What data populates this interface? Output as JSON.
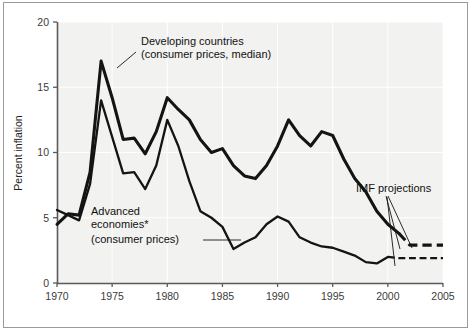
{
  "chart_data": {
    "type": "line",
    "title": "",
    "xlabel": "",
    "ylabel": "Percent inflation",
    "xlim": [
      1970,
      2005
    ],
    "ylim": [
      0,
      20
    ],
    "grid": true,
    "legend_position": "inline-annotations",
    "x_ticks": [
      1970,
      1975,
      1980,
      1985,
      1990,
      1995,
      2000,
      2005
    ],
    "y_ticks": [
      0,
      5,
      10,
      15,
      20
    ],
    "x": [
      1970,
      1971,
      1972,
      1973,
      1974,
      1975,
      1976,
      1977,
      1978,
      1979,
      1980,
      1981,
      1982,
      1983,
      1984,
      1985,
      1986,
      1987,
      1988,
      1989,
      1990,
      1991,
      1992,
      1993,
      1994,
      1995,
      1996,
      1997,
      1998,
      1999,
      2000,
      2001,
      2002,
      2003,
      2004,
      2005
    ],
    "series": [
      {
        "name": "Developing countries (consumer prices, median)",
        "style": "thick-solid",
        "values": [
          4.5,
          5.3,
          5.2,
          8.5,
          17.0,
          14.2,
          11.0,
          11.1,
          9.9,
          11.6,
          14.2,
          13.3,
          12.5,
          11.0,
          10.0,
          10.3,
          9.0,
          8.2,
          8.0,
          9.0,
          10.5,
          12.5,
          11.3,
          10.5,
          11.6,
          11.3,
          9.5,
          8.0,
          7.0,
          5.5,
          4.5,
          3.8,
          2.9,
          2.9,
          2.9,
          2.9
        ],
        "projection_starts": 2001,
        "projection_value": 2.9
      },
      {
        "name": "Advanced economies* (consumer prices)",
        "style": "medium-solid",
        "values": [
          5.6,
          5.2,
          4.8,
          7.6,
          14.0,
          11.2,
          8.4,
          8.5,
          7.2,
          9.0,
          12.5,
          10.5,
          7.8,
          5.5,
          5.0,
          4.3,
          2.6,
          3.1,
          3.5,
          4.5,
          5.1,
          4.7,
          3.5,
          3.1,
          2.8,
          2.7,
          2.4,
          2.1,
          1.6,
          1.5,
          2.0,
          1.9,
          1.9,
          1.9,
          1.9,
          1.9
        ],
        "projection_starts": 2000,
        "projection_value": 1.9
      }
    ],
    "annotations": [
      {
        "id": "developing-label",
        "lines": [
          "Developing countries",
          "(consumer prices, median)"
        ],
        "points_to_series": "Developing countries (consumer prices, median)"
      },
      {
        "id": "advanced-label",
        "lines": [
          "Advanced",
          "economies*",
          "(consumer prices)"
        ],
        "points_to_series": "Advanced economies* (consumer prices)"
      },
      {
        "id": "projections-label",
        "lines": [
          "IMF projections"
        ],
        "points_to_series": "both-dashed-segments"
      }
    ]
  },
  "axes": {
    "y_title": "Percent inflation",
    "y_tick_labels": [
      "0",
      "5",
      "10",
      "15",
      "20"
    ],
    "x_tick_labels": [
      "1970",
      "1975",
      "1980",
      "1985",
      "1990",
      "1995",
      "2000",
      "2005"
    ]
  },
  "labels": {
    "developing_line1": "Developing countries",
    "developing_line2": "(consumer prices, median)",
    "advanced_line1": "Advanced",
    "advanced_line2": "economies*",
    "advanced_line3": "(consumer prices)",
    "imf_projections": "IMF projections"
  },
  "colors": {
    "plot_background": "#f2f2f0",
    "line": "#141414",
    "gridline": "#ffffff",
    "axis": "#5a5a5a",
    "frame": "#9a9a9a",
    "text": "#222222"
  }
}
